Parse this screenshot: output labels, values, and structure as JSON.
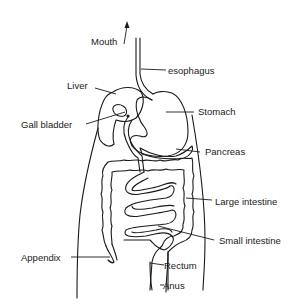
{
  "diagram": {
    "line_color": "#1a1a1a",
    "background": "#ffffff",
    "labels": {
      "mouth": "Mouth",
      "esophagus": "esophagus",
      "liver": "Liver",
      "gall_bladder": "Gall bladder",
      "stomach": "Stomach",
      "pancreas": "Pancreas",
      "large_intestine": "Large intestine",
      "small_intestine": "Small intestine",
      "appendix": "Appendix",
      "rectum": "Rectum",
      "anus": "Anus"
    }
  }
}
